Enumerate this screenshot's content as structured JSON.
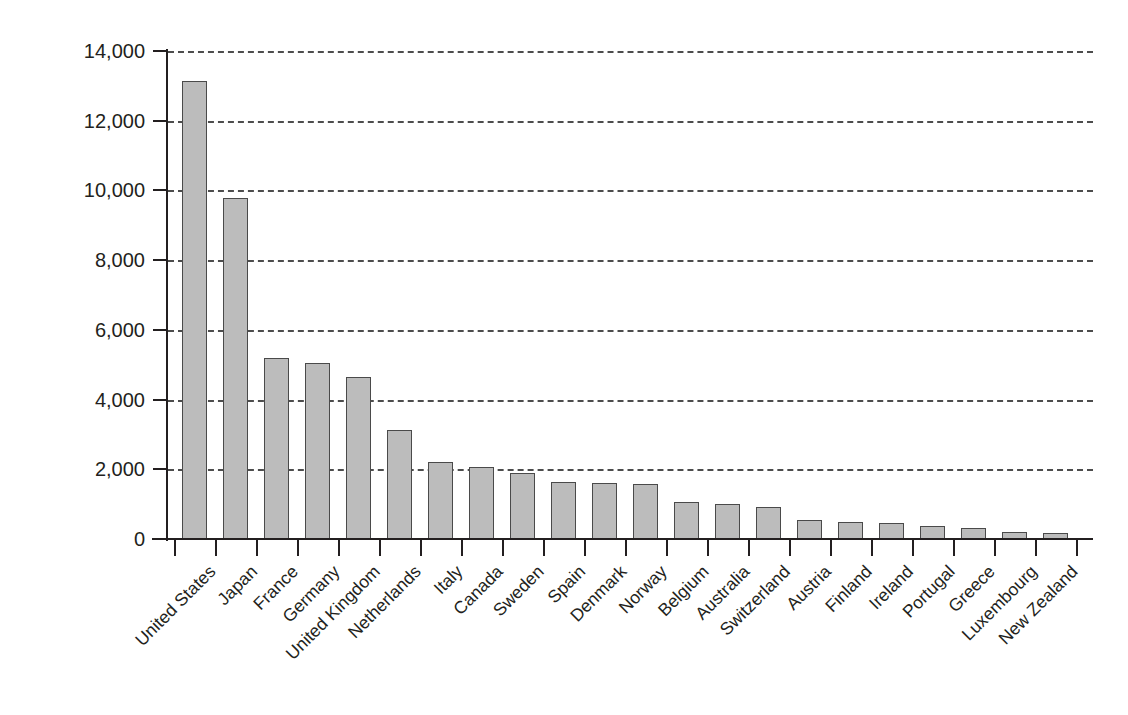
{
  "chart_data": {
    "type": "bar",
    "title": "",
    "xlabel": "",
    "ylabel": "Million US Dollars (2001)",
    "ylim": [
      0,
      14000
    ],
    "ytick_values": [
      0,
      2000,
      4000,
      6000,
      8000,
      10000,
      12000,
      14000
    ],
    "ytick_labels": [
      "0",
      "2,000",
      "4,000",
      "6,000",
      "8,000",
      "10,000",
      "12,000",
      "14,000"
    ],
    "grid": "horizontal-dashed",
    "legend": "none",
    "bar_color": "#bcbcbc",
    "bar_edge_color": "#4a4a4a",
    "grid_color": "#4d4d4d",
    "axis_color": "#231f20",
    "categories": [
      "United States",
      "Japan",
      "France",
      "Germany",
      "United Kingdom",
      "Netherlands",
      "Italy",
      "Canada",
      "Sweden",
      "Spain",
      "Denmark",
      "Norway",
      "Belgium",
      "Australia",
      "Switzerland",
      "Austria",
      "Finland",
      "Ireland",
      "Portugal",
      "Greece",
      "Luxembourg",
      "New Zealand"
    ],
    "values": [
      13150,
      9780,
      5180,
      5040,
      4660,
      3130,
      2220,
      2070,
      1900,
      1630,
      1610,
      1590,
      1060,
      1000,
      920,
      550,
      490,
      450,
      370,
      320,
      200,
      160
    ]
  }
}
